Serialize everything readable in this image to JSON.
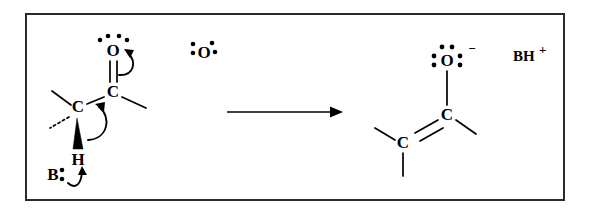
{
  "figure": {
    "border_color": "#2b2b2b",
    "background_color": "#ffffff",
    "ink_color": "#000000"
  },
  "reactant": {
    "carbonyl_oxygen": {
      "symbol": "O",
      "lone_pairs": 2,
      "dot_count": 4
    },
    "carbonyl_carbon": {
      "symbol": "C"
    },
    "alpha_carbon": {
      "symbol": "C"
    },
    "alpha_hydrogen": {
      "symbol": "H"
    },
    "bonds": {
      "c_o": "double",
      "c_c": "single",
      "alpha_h": "wedge",
      "alpha_methyl_up": "plain",
      "alpha_methyl_down": "dashed",
      "carbonyl_methyl": "plain"
    }
  },
  "base": {
    "symbol": "B",
    "lone_pairs": 1,
    "dot_count": 2
  },
  "radical_oxygen": {
    "symbol": "O",
    "dot_count": 4,
    "note": "stray oxygen with dots, left / top-left / top-right / right"
  },
  "arrows": {
    "reaction_arrow": "→",
    "curved_arrow_1": "C=O pi bond to oxygen",
    "curved_arrow_2": "C-H bond to C-C bond forming pi",
    "curved_arrow_3": "base lone pair to alpha hydrogen"
  },
  "product": {
    "enolate_oxygen": {
      "symbol": "O",
      "lone_pairs": 3,
      "dot_count": 6,
      "charge": "−"
    },
    "sp2_carbon_right": {
      "symbol": "C"
    },
    "sp2_carbon_left": {
      "symbol": "C"
    },
    "bonds": {
      "o_c": "single",
      "c_c": "double",
      "right_methyl": "plain",
      "left_methyl_up": "plain",
      "left_methyl_down": "plain"
    },
    "conjugate_acid": "BH",
    "conjugate_acid_charge": "+"
  }
}
